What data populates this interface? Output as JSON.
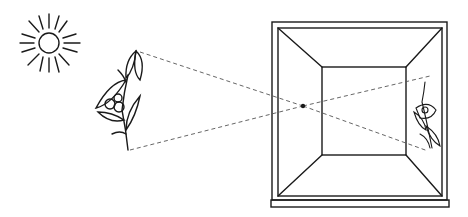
{
  "diagram": {
    "type": "pinhole-camera-illustration",
    "elements": [
      "sun",
      "plant",
      "light-rays",
      "camera-box",
      "pinhole",
      "inverted-image"
    ],
    "colors": {
      "ink": "#1a1a1a",
      "background": "#ffffff",
      "ray": "#555555"
    }
  }
}
